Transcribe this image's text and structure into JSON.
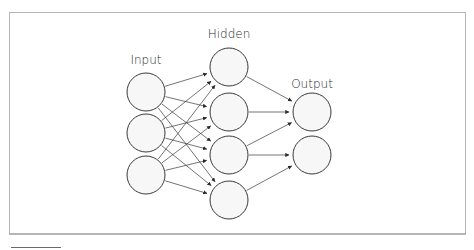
{
  "diagram": {
    "layers": [
      {
        "name": "input",
        "label": "Input",
        "x": 146,
        "label_y": 64,
        "nodes": [
          92,
          133,
          175
        ],
        "r": 19
      },
      {
        "name": "hidden",
        "label": "Hidden",
        "x": 229,
        "label_y": 38,
        "nodes": [
          67,
          112,
          155,
          200
        ],
        "r": 19
      },
      {
        "name": "output",
        "label": "Output",
        "x": 312,
        "label_y": 88,
        "nodes": [
          112,
          155
        ],
        "r": 19
      }
    ],
    "edges": [
      {
        "from": "input.0",
        "to": "hidden.0"
      },
      {
        "from": "input.0",
        "to": "hidden.1"
      },
      {
        "from": "input.0",
        "to": "hidden.2"
      },
      {
        "from": "input.0",
        "to": "hidden.3"
      },
      {
        "from": "input.1",
        "to": "hidden.0"
      },
      {
        "from": "input.1",
        "to": "hidden.1"
      },
      {
        "from": "input.1",
        "to": "hidden.2"
      },
      {
        "from": "input.1",
        "to": "hidden.3"
      },
      {
        "from": "input.2",
        "to": "hidden.0"
      },
      {
        "from": "input.2",
        "to": "hidden.1"
      },
      {
        "from": "input.2",
        "to": "hidden.2"
      },
      {
        "from": "input.2",
        "to": "hidden.3"
      },
      {
        "from": "hidden.0",
        "to": "output.0"
      },
      {
        "from": "hidden.1",
        "to": "output.0"
      },
      {
        "from": "hidden.2",
        "to": "output.0"
      },
      {
        "from": "hidden.2",
        "to": "output.1"
      },
      {
        "from": "hidden.3",
        "to": "output.1"
      }
    ],
    "colors": {
      "node_fill": "#f7f7f7",
      "stroke": "#3a3a3a",
      "frame": "#b5b5b5"
    }
  }
}
